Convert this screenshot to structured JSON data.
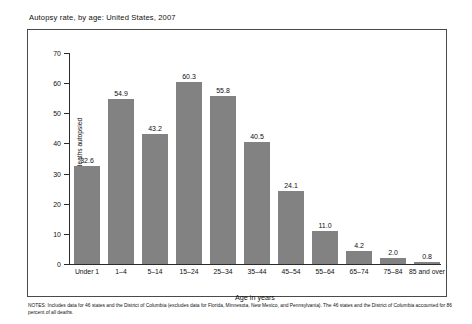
{
  "figure": {
    "title": "Autopsy rate, by age: United States, 2007",
    "notes": "NOTES: Includes data for 46 states and the District of Columbia (excludes data for Florida, Minnesota, New Mexico, and Pennsylvania). The 46 states and the District of Columbia accounted for 86 percent of all deaths."
  },
  "chart_data": {
    "type": "bar",
    "title": "Autopsy rate, by age: United States, 2007",
    "xlabel": "Age in years",
    "ylabel": "Percent of deaths autopsied",
    "categories": [
      "Under 1",
      "1–4",
      "5–14",
      "15–24",
      "25–34",
      "35–44",
      "45–54",
      "55–64",
      "65–74",
      "75–84",
      "85 and over"
    ],
    "values": [
      32.6,
      54.9,
      43.2,
      60.3,
      55.8,
      40.5,
      24.1,
      11.0,
      4.2,
      2.0,
      0.8
    ],
    "value_labels": [
      "32.6",
      "54.9",
      "43.2",
      "60.3",
      "55.8",
      "40.5",
      "24.1",
      "11.0",
      "4.2",
      "2.0",
      "0.8"
    ],
    "ylim": [
      0,
      70
    ],
    "yticks": [
      0,
      10,
      20,
      30,
      40,
      50,
      60,
      70
    ],
    "ytick_labels": [
      "0",
      "10",
      "20",
      "30",
      "40",
      "50",
      "60",
      "70"
    ],
    "grid": false,
    "legend": null,
    "bar_color": "#828282",
    "axis_color": "#2b2b2b"
  }
}
